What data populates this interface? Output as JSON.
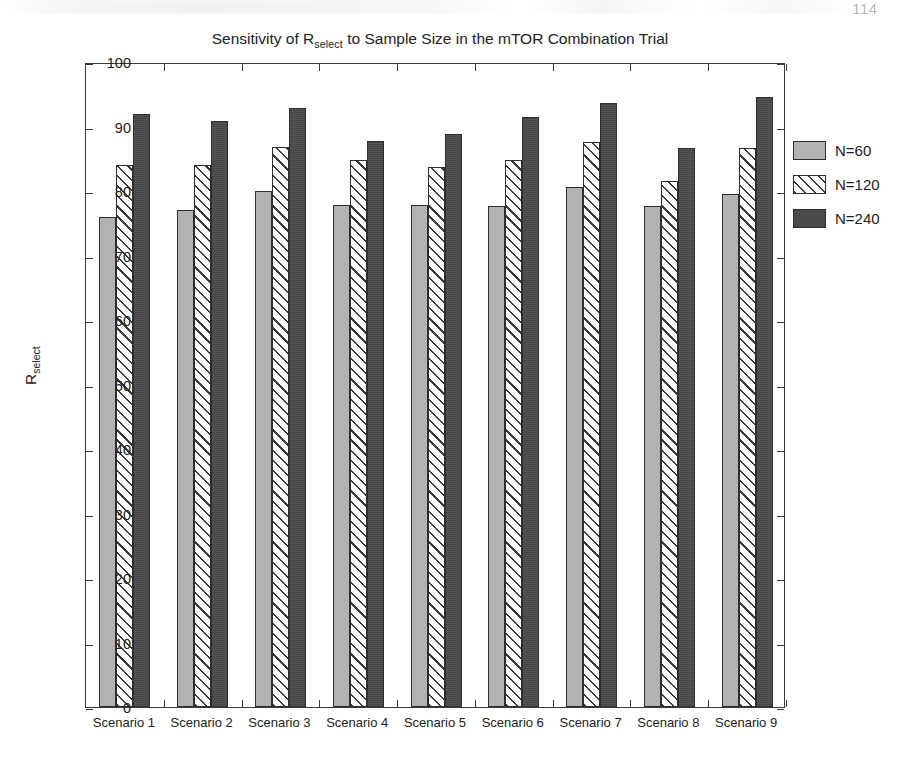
{
  "page": {
    "page_number": "114"
  },
  "figure": {
    "title_prefix": "Sensitivity of R",
    "title_subscript": "select",
    "title_suffix": " to Sample Size in the mTOR Combination Trial",
    "ylabel_main": "R",
    "ylabel_subscript": "select"
  },
  "legend": {
    "position": "right",
    "entries": [
      {
        "label": "N=60",
        "style": "solid-light-gray",
        "color": "#b2b2b2"
      },
      {
        "label": "N=120",
        "style": "diagonal-hatch",
        "color": "#ffffff"
      },
      {
        "label": "N=240",
        "style": "solid-dark-gray",
        "color": "#4a4a4a"
      }
    ]
  },
  "chart_data": {
    "type": "bar",
    "xlabel": "",
    "ylabel": "R_select",
    "ylim": [
      0,
      100
    ],
    "yticks": [
      0,
      10,
      20,
      30,
      40,
      50,
      60,
      70,
      80,
      90,
      100
    ],
    "grid": false,
    "legend_position": "right",
    "categories": [
      "Scenario 1",
      "Scenario 2",
      "Scenario 3",
      "Scenario 4",
      "Scenario 5",
      "Scenario 6",
      "Scenario 7",
      "Scenario 8",
      "Scenario 9"
    ],
    "series": [
      {
        "name": "N=60",
        "color": "#b2b2b2",
        "values": [
          76.0,
          77.0,
          80.0,
          77.9,
          77.8,
          77.7,
          80.7,
          77.7,
          79.5
        ]
      },
      {
        "name": "N=120",
        "color": "#ffffff",
        "values": [
          84.0,
          84.0,
          86.9,
          84.8,
          83.7,
          84.8,
          87.6,
          81.5,
          86.6
        ]
      },
      {
        "name": "N=240",
        "color": "#4a4a4a",
        "values": [
          91.9,
          90.9,
          92.8,
          87.8,
          88.9,
          91.5,
          93.6,
          86.6,
          94.5
        ]
      }
    ]
  }
}
